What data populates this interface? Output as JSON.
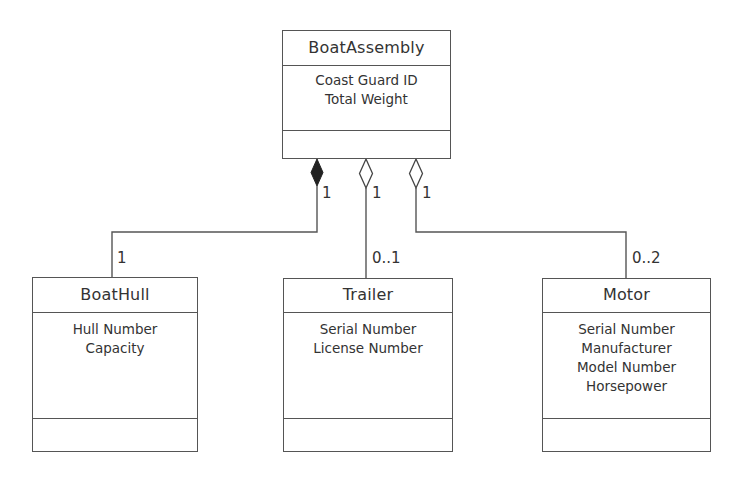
{
  "diagram": {
    "type": "UML class diagram",
    "colors": {
      "line": "#555555",
      "text": "#333333",
      "background": "#ffffff"
    },
    "classes": [
      {
        "id": "boat-assembly",
        "name": "BoatAssembly",
        "attributes": [
          "Coast Guard ID",
          "Total Weight"
        ],
        "operations": []
      },
      {
        "id": "boat-hull",
        "name": "BoatHull",
        "attributes": [
          "Hull Number",
          "Capacity"
        ],
        "operations": []
      },
      {
        "id": "trailer",
        "name": "Trailer",
        "attributes": [
          "Serial Number",
          "License Number"
        ],
        "operations": []
      },
      {
        "id": "motor",
        "name": "Motor",
        "attributes": [
          "Serial Number",
          "Manufacturer",
          "Model Number",
          "Horsepower"
        ],
        "operations": []
      }
    ],
    "associations": [
      {
        "from": "BoatAssembly",
        "to": "BoatHull",
        "kind": "composition",
        "whole_multiplicity": "1",
        "part_multiplicity": "1"
      },
      {
        "from": "BoatAssembly",
        "to": "Trailer",
        "kind": "aggregation",
        "whole_multiplicity": "1",
        "part_multiplicity": "0..1"
      },
      {
        "from": "BoatAssembly",
        "to": "Motor",
        "kind": "aggregation",
        "whole_multiplicity": "1",
        "part_multiplicity": "0..2"
      }
    ]
  }
}
